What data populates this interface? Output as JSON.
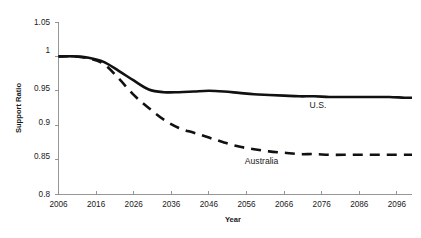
{
  "chart_data": {
    "type": "line",
    "title": "",
    "xlabel": "Year",
    "ylabel": "Support Ratio",
    "xlim": [
      2006,
      2100
    ],
    "ylim": [
      0.8,
      1.05
    ],
    "grid": false,
    "legend_position": "inline-annotations",
    "x_ticks": [
      "2006",
      "2016",
      "2026",
      "2036",
      "2046",
      "2056",
      "2066",
      "2076",
      "2086",
      "2096"
    ],
    "x_tick_values": [
      2006,
      2016,
      2026,
      2036,
      2046,
      2056,
      2066,
      2076,
      2086,
      2096
    ],
    "y_ticks": [
      "0.8",
      "0.85",
      "0.9",
      "0.95",
      "1",
      "1.05"
    ],
    "y_tick_values": [
      0.8,
      0.85,
      0.9,
      0.95,
      1.0,
      1.05
    ],
    "x": [
      2006,
      2010,
      2014,
      2018,
      2022,
      2026,
      2030,
      2034,
      2038,
      2042,
      2046,
      2050,
      2054,
      2058,
      2062,
      2066,
      2070,
      2074,
      2078,
      2082,
      2086,
      2090,
      2094,
      2098,
      2100
    ],
    "series": [
      {
        "name": "U.S.",
        "style": "solid",
        "color": "#111111",
        "label_x": 2075,
        "label_y": 0.925,
        "values": [
          1.0,
          1.0,
          0.998,
          0.992,
          0.979,
          0.965,
          0.952,
          0.948,
          0.948,
          0.949,
          0.95,
          0.949,
          0.947,
          0.945,
          0.944,
          0.943,
          0.942,
          0.942,
          0.941,
          0.941,
          0.941,
          0.941,
          0.941,
          0.94,
          0.94
        ]
      },
      {
        "name": "Australia",
        "style": "dashed",
        "color": "#111111",
        "label_x": 2060,
        "label_y": 0.843,
        "values": [
          1.0,
          1.0,
          0.997,
          0.989,
          0.968,
          0.944,
          0.925,
          0.908,
          0.896,
          0.889,
          0.882,
          0.875,
          0.869,
          0.865,
          0.862,
          0.86,
          0.858,
          0.858,
          0.857,
          0.857,
          0.857,
          0.857,
          0.857,
          0.857,
          0.857
        ]
      }
    ],
    "annotations": [
      {
        "text": "U.S.",
        "x": 2075,
        "y": 0.925
      },
      {
        "text": "Australia",
        "x": 2060,
        "y": 0.843
      }
    ]
  }
}
